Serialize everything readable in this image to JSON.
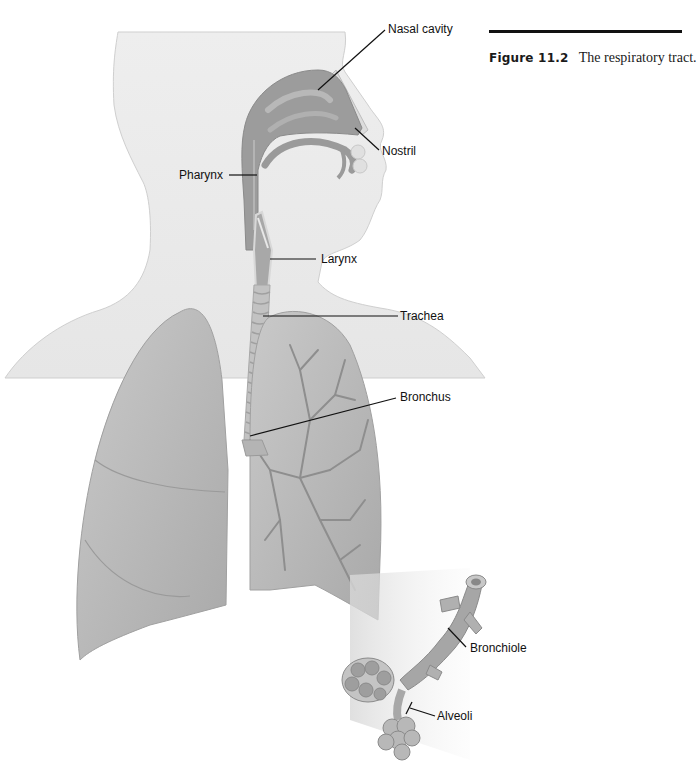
{
  "figure": {
    "number": "Figure 11.2",
    "caption": "The respiratory tract.",
    "colors": {
      "background": "#ffffff",
      "skin": "#ececec",
      "organ": "#9a9a9a",
      "lung": "#bdbdbd",
      "leader_line": "#111111"
    }
  },
  "labels": [
    {
      "id": "nasal-cavity",
      "text": "Nasal cavity"
    },
    {
      "id": "nostril",
      "text": "Nostril"
    },
    {
      "id": "pharynx",
      "text": "Pharynx"
    },
    {
      "id": "larynx",
      "text": "Larynx"
    },
    {
      "id": "trachea",
      "text": "Trachea"
    },
    {
      "id": "bronchus",
      "text": "Bronchus"
    },
    {
      "id": "bronchiole",
      "text": "Bronchiole"
    },
    {
      "id": "alveoli",
      "text": "Alveoli"
    }
  ]
}
